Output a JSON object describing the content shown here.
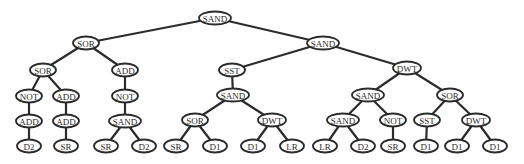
{
  "diagram": {
    "type": "tree",
    "colors": {
      "stroke": "#2b2b2b",
      "node_fill": "#ffffff",
      "background": "#ffffff"
    },
    "nodes": [
      {
        "id": "n0",
        "label": "SAND",
        "x": 215,
        "y": 18,
        "rx": 16,
        "parent": null
      },
      {
        "id": "n1",
        "label": "SOR",
        "x": 86,
        "y": 43,
        "rx": 13,
        "parent": "n0"
      },
      {
        "id": "n2",
        "label": "SAND",
        "x": 323,
        "y": 43,
        "rx": 16,
        "parent": "n0"
      },
      {
        "id": "n3",
        "label": "SOR",
        "x": 43,
        "y": 70,
        "rx": 13,
        "parent": "n1"
      },
      {
        "id": "n4",
        "label": "ADD",
        "x": 125,
        "y": 70,
        "rx": 13,
        "parent": "n1"
      },
      {
        "id": "n5",
        "label": "SST",
        "x": 232,
        "y": 70,
        "rx": 13,
        "parent": "n2"
      },
      {
        "id": "n6",
        "label": "DWT",
        "x": 407,
        "y": 68,
        "rx": 14,
        "parent": "n2"
      },
      {
        "id": "n7",
        "label": "NOT",
        "x": 29,
        "y": 96,
        "rx": 13,
        "parent": "n3"
      },
      {
        "id": "n8",
        "label": "ADD",
        "x": 66,
        "y": 96,
        "rx": 13,
        "parent": "n3"
      },
      {
        "id": "n9",
        "label": "NOT",
        "x": 125,
        "y": 96,
        "rx": 13,
        "parent": "n4"
      },
      {
        "id": "n10",
        "label": "SAND",
        "x": 233,
        "y": 95,
        "rx": 16,
        "parent": "n5"
      },
      {
        "id": "n11",
        "label": "SAND",
        "x": 368,
        "y": 95,
        "rx": 16,
        "parent": "n6"
      },
      {
        "id": "n12",
        "label": "SOR",
        "x": 450,
        "y": 95,
        "rx": 13,
        "parent": "n6"
      },
      {
        "id": "n13",
        "label": "ADD",
        "x": 29,
        "y": 121,
        "rx": 13,
        "parent": "n7"
      },
      {
        "id": "n14",
        "label": "ADD",
        "x": 66,
        "y": 121,
        "rx": 13,
        "parent": "n8"
      },
      {
        "id": "n15",
        "label": "SAND",
        "x": 125,
        "y": 121,
        "rx": 16,
        "parent": "n9"
      },
      {
        "id": "n16",
        "label": "SOR",
        "x": 195,
        "y": 120,
        "rx": 13,
        "parent": "n10"
      },
      {
        "id": "n17",
        "label": "DWT",
        "x": 272,
        "y": 120,
        "rx": 14,
        "parent": "n10"
      },
      {
        "id": "n18",
        "label": "SAND",
        "x": 343,
        "y": 120,
        "rx": 16,
        "parent": "n11"
      },
      {
        "id": "n19",
        "label": "NOT",
        "x": 393,
        "y": 120,
        "rx": 13,
        "parent": "n11"
      },
      {
        "id": "n20",
        "label": "SST",
        "x": 427,
        "y": 120,
        "rx": 13,
        "parent": "n12"
      },
      {
        "id": "n21",
        "label": "DWT",
        "x": 476,
        "y": 120,
        "rx": 14,
        "parent": "n12"
      },
      {
        "id": "n22",
        "label": "D2",
        "x": 29,
        "y": 146,
        "rx": 12,
        "parent": "n13"
      },
      {
        "id": "n23",
        "label": "SR",
        "x": 66,
        "y": 146,
        "rx": 12,
        "parent": "n14"
      },
      {
        "id": "n24",
        "label": "SR",
        "x": 106,
        "y": 146,
        "rx": 12,
        "parent": "n15"
      },
      {
        "id": "n25",
        "label": "D2",
        "x": 144,
        "y": 146,
        "rx": 12,
        "parent": "n15"
      },
      {
        "id": "n26",
        "label": "SR",
        "x": 176,
        "y": 146,
        "rx": 12,
        "parent": "n16"
      },
      {
        "id": "n27",
        "label": "D1",
        "x": 215,
        "y": 146,
        "rx": 12,
        "parent": "n16"
      },
      {
        "id": "n28",
        "label": "D1",
        "x": 253,
        "y": 146,
        "rx": 12,
        "parent": "n17"
      },
      {
        "id": "n29",
        "label": "LR",
        "x": 292,
        "y": 146,
        "rx": 12,
        "parent": "n17"
      },
      {
        "id": "n30",
        "label": "LR",
        "x": 325,
        "y": 146,
        "rx": 12,
        "parent": "n18"
      },
      {
        "id": "n31",
        "label": "D2",
        "x": 363,
        "y": 146,
        "rx": 12,
        "parent": "n18"
      },
      {
        "id": "n32",
        "label": "SR",
        "x": 393,
        "y": 146,
        "rx": 12,
        "parent": "n19"
      },
      {
        "id": "n33",
        "label": "D1",
        "x": 426,
        "y": 146,
        "rx": 12,
        "parent": "n20"
      },
      {
        "id": "n34",
        "label": "D1",
        "x": 457,
        "y": 146,
        "rx": 12,
        "parent": "n21"
      },
      {
        "id": "n35",
        "label": "D1",
        "x": 495,
        "y": 146,
        "rx": 12,
        "parent": "n21"
      }
    ]
  }
}
